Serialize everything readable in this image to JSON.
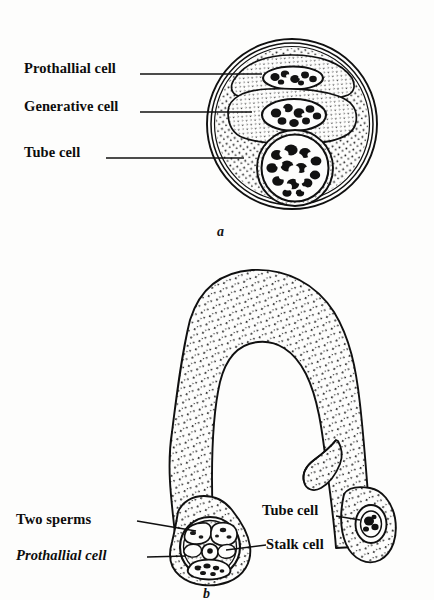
{
  "figure": {
    "panels": [
      {
        "letter": "a",
        "caption": "a",
        "description": "Pollen grain in section showing prothallial cell, generative cell and tube cell",
        "labels": [
          {
            "id": "prothallial",
            "text": "Prothallial cell"
          },
          {
            "id": "generative",
            "text": "Generative cell"
          },
          {
            "id": "tube",
            "text": "Tube cell"
          }
        ]
      },
      {
        "letter": "b",
        "caption": "b",
        "description": "Germinated pollen grain with pollen tube bearing two sperms, stalk cell, prothallial cell and tube cell nucleus",
        "labels": [
          {
            "id": "two-sperms",
            "text": "Two sperms",
            "style": "bold"
          },
          {
            "id": "prothallial",
            "text": "Prothallial cell",
            "style": "italic"
          },
          {
            "id": "tube",
            "text": "Tube cell",
            "style": "bold"
          },
          {
            "id": "stalk",
            "text": "Stalk cell",
            "style": "bold"
          }
        ]
      }
    ]
  },
  "style": {
    "ink": "#101010",
    "paper": "#fdfdfc",
    "stipple": "#1a1a1a"
  }
}
